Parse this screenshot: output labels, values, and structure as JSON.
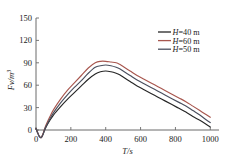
{
  "chart_data": {
    "type": "line",
    "title": "",
    "xlabel": "T/s",
    "ylabel": "Fv/m3",
    "ylabel_display": "Fv/m",
    "ylabel_exponent": "3",
    "xlim": [
      0,
      1050
    ],
    "ylim": [
      -12,
      150
    ],
    "grid": false,
    "legend_position": "top-right",
    "xticks": [
      0,
      200,
      400,
      600,
      800,
      1000
    ],
    "xtick_labels": [
      "0",
      "200",
      "400",
      "600",
      "800",
      "1000"
    ],
    "yticks": [
      0,
      30,
      60,
      90,
      120,
      150
    ],
    "ytick_labels": [
      "0",
      "30",
      "60",
      "90",
      "120",
      "150"
    ],
    "x": [
      0,
      10,
      20,
      30,
      40,
      50,
      60,
      80,
      100,
      140,
      180,
      220,
      260,
      300,
      340,
      370,
      400,
      430,
      460,
      480,
      500,
      540,
      580,
      620,
      660,
      700,
      740,
      780,
      820,
      860,
      900,
      940,
      980,
      1000
    ],
    "series": [
      {
        "name": "H=40 m",
        "label": "H=40 m",
        "color": "#262626",
        "values": [
          2,
          -4,
          -9,
          -10,
          -6,
          0,
          5,
          13,
          20,
          31,
          41,
          50,
          59,
          68,
          75,
          78,
          79,
          78,
          76,
          74,
          71,
          65,
          59,
          54,
          49,
          44,
          39,
          34,
          29,
          24,
          18,
          13,
          7,
          4
        ]
      },
      {
        "name": "H=60 m",
        "label": "H=60 m",
        "color": "#a8574f",
        "values": [
          2,
          -4,
          -9,
          -10,
          -5,
          2,
          8,
          18,
          27,
          41,
          53,
          63,
          73,
          83,
          90,
          92,
          92,
          91,
          90,
          88,
          85,
          79,
          73,
          68,
          63,
          58,
          53,
          48,
          43,
          38,
          32,
          26,
          20,
          17
        ]
      },
      {
        "name": "H=50 m",
        "label": "H=50 m",
        "color": "#4a4f5e",
        "values": [
          2,
          -4,
          -9,
          -10,
          -6,
          1,
          6,
          15,
          23,
          36,
          47,
          57,
          66,
          76,
          84,
          86,
          87,
          86,
          84,
          82,
          79,
          73,
          67,
          62,
          57,
          52,
          47,
          42,
          37,
          32,
          26,
          20,
          13,
          10
        ]
      }
    ],
    "legend_order": [
      "H=40 m",
      "H=60 m",
      "H=50 m"
    ]
  },
  "axis": {
    "x_title": "T/s",
    "y_title_base": "Fv/m",
    "y_title_sup": "3"
  }
}
